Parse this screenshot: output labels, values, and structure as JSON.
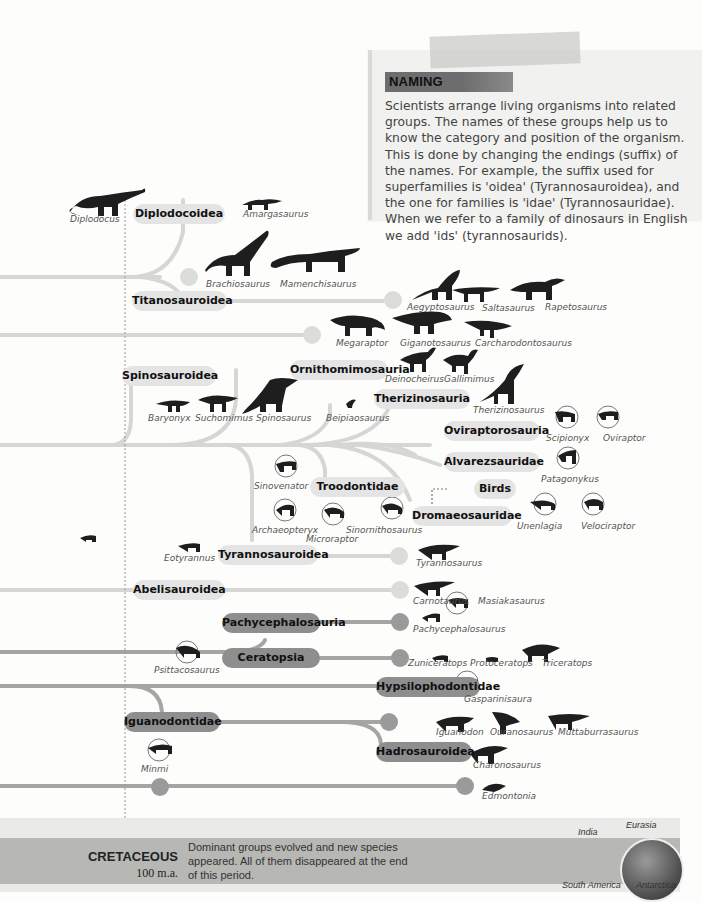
{
  "note": {
    "title": "NAMING",
    "body": "Scientists arrange living organisms into related groups. The names of these groups help us to know the category and position of the organism. This is done by changing the endings (suffix) of the names. For example, the suffix used for superfamilies is 'oidea' (Tyrannosauroidea), and the one for families is 'idae' (Tyrannosauridae). When we refer to a family of dinosaurs in English we add 'ids' (tyrannosaurids)."
  },
  "groups": {
    "diplodocoidea": "Diplodocoidea",
    "titanosauroidea": "Titanosauroidea",
    "spinosauroidea": "Spinosauroidea",
    "ornithomimosauria": "Ornithomimosauria",
    "therizinosauria": "Therizinosauria",
    "oviraptorosauria": "Oviraptorosauria",
    "alvarezsauridae": "Alvarezsauridae",
    "birds": "Birds",
    "troodontidae": "Troodontidae",
    "dromaeosauridae": "Dromaeosauridae",
    "tyrannosauroidea": "Tyrannosauroidea",
    "abelisauroidea": "Abelisauroidea",
    "pachycephalosauria": "Pachycephalosauria",
    "ceratopsia": "Ceratopsia",
    "hypsilophodontidae": "Hypsilophodontidae",
    "iguanodontidae": "Iguanodontidae",
    "hadrosauroidea": "Hadrosauroidea"
  },
  "species": {
    "diplodocus": "Diplodocus",
    "amargasaurus": "Amargasaurus",
    "brachiosaurus": "Brachiosaurus",
    "mamenchisaurus": "Mamenchisaurus",
    "aegyptosaurus": "Aegyptosaurus",
    "saltasaurus": "Saltasaurus",
    "rapetosaurus": "Rapetosaurus",
    "megaraptor": "Megaraptor",
    "giganotosaurus": "Giganotosaurus",
    "carcharodontosaurus": "Carcharodontosaurus",
    "deinocheirus": "Deinocheirus",
    "gallimimus": "Gallimimus",
    "baryonyx": "Baryonyx",
    "suchomimus": "Suchomimus",
    "spinosaurus": "Spinosaurus",
    "beipiaosaurus": "Beipiaosaurus",
    "therizinosaurus": "Therizinosaurus",
    "scipionyx": "Scipionyx",
    "oviraptor": "Oviraptor",
    "patagonykus": "Patagonykus",
    "sinovenator": "Sinovenator",
    "archaeopteryx": "Archaeopteryx",
    "microraptor": "Microraptor",
    "sinornithosaurus": "Sinornithosaurus",
    "unenlagia": "Unenlagia",
    "velociraptor": "Velociraptor",
    "eotyrannus": "Eotyrannus",
    "tyrannosaurus": "Tyrannosaurus",
    "carnotaurus": "Carnotaurus",
    "masiakasaurus": "Masiakasaurus",
    "pachycephalosaurus": "Pachycephalosaurus",
    "psittacosaurus": "Psittacosaurus",
    "zuniceratops": "Zuniceratops",
    "protoceratops": "Protoceratops",
    "triceratops": "Triceratops",
    "gasparinisaura": "Gasparinisaura",
    "iguanodon": "Iguanodon",
    "ouranosaurus": "Ouranosaurus",
    "muttaburrasaurus": "Muttaburrasaurus",
    "charonosaurus": "Charonosaurus",
    "minmi": "Minmi",
    "edmontonia": "Edmontonia"
  },
  "period": {
    "name": "CRETACEOUS",
    "age": "100 m.a.",
    "description": "Dominant groups evolved and new species appeared. All of them disappeared at the end of this period.",
    "globe_labels": {
      "india": "India",
      "eurasia": "Eurasia",
      "south_america": "South America",
      "antarctica": "Antarctica"
    }
  },
  "colors": {
    "light_branch": "#d6d6d4",
    "dark_branch": "#9a9a9a",
    "light_pill": "#e4e4e4",
    "dark_pill": "#8e8e8e",
    "silhouette": "#1e1e1e"
  }
}
